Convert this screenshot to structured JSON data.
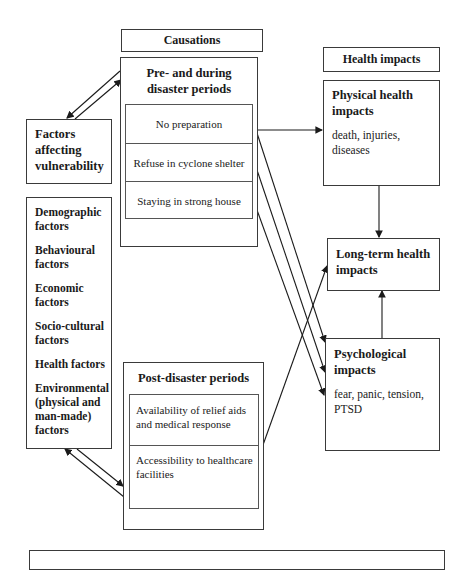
{
  "causations": {
    "header": "Causations",
    "pre_during": {
      "title_line1": "Pre- and during",
      "title_line2": "disaster periods",
      "items": [
        "No preparation",
        "Refuse in cyclone shelter",
        "Staying in strong house"
      ]
    },
    "post": {
      "title": "Post-disaster periods",
      "items": [
        {
          "line1": "Availability of relief aids",
          "line2": "and medical response"
        },
        {
          "line1": "Accessibility to healthcare",
          "line2": "facilities"
        }
      ]
    }
  },
  "vulnerability": {
    "title_lines": [
      "Factors",
      "affecting",
      "vulnerability"
    ],
    "factors": [
      {
        "lines": [
          "Demographic",
          "factors"
        ]
      },
      {
        "lines": [
          "Behavioural",
          "factors"
        ]
      },
      {
        "lines": [
          "Economic",
          "factors"
        ]
      },
      {
        "lines": [
          "Socio-cultural",
          "factors"
        ]
      },
      {
        "lines": [
          "Health factors"
        ]
      },
      {
        "lines": [
          "Environmental",
          "(physical and",
          "man-made)",
          "factors"
        ]
      }
    ]
  },
  "health_impacts": {
    "header": "Health impacts",
    "physical": {
      "title_line1": "Physical health",
      "title_line2": "impacts",
      "desc_line1": "death, injuries,",
      "desc_line2": "diseases"
    },
    "long_term": {
      "title_line1": "Long-term health",
      "title_line2": "impacts"
    },
    "psychological": {
      "title_line1": "Psychological",
      "title_line2": "impacts",
      "desc_line1": "fear, panic, tension,",
      "desc_line2": "PTSD"
    }
  },
  "colors": {
    "line": "#1a1a1a",
    "border": "#3a3a3a",
    "background": "#ffffff"
  }
}
